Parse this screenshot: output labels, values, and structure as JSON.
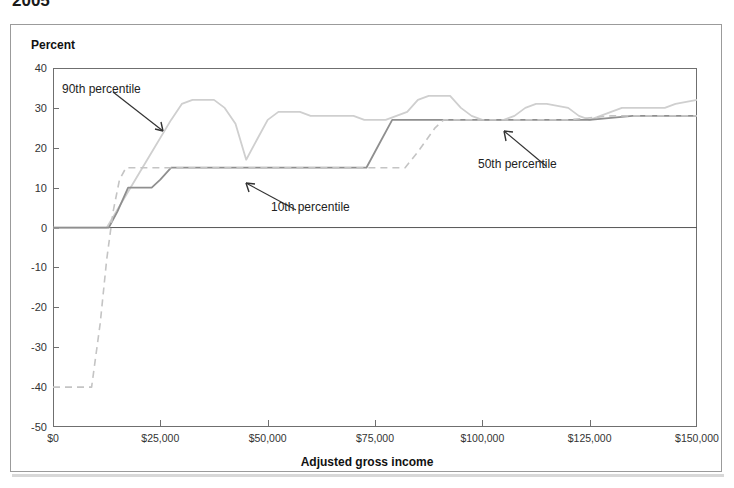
{
  "title_clipped": "2005",
  "axis": {
    "y_label": "Percent",
    "x_label": "Adjusted gross income",
    "y_ticks": [
      40,
      30,
      20,
      10,
      0,
      -10,
      -20,
      -30,
      -40,
      -50
    ],
    "x_ticks": [
      "$0",
      "$25,000",
      "$50,000",
      "$75,000",
      "$100,000",
      "$125,000",
      "$150,000"
    ]
  },
  "annotations": [
    {
      "name": "90th-percentile",
      "text": "90th percentile"
    },
    {
      "name": "10th-percentile",
      "text": "10th percentile"
    },
    {
      "name": "50th-percentile",
      "text": "50th percentile"
    }
  ],
  "colors": {
    "p90": "#cfcfcf",
    "p50": "#8f8f8f",
    "p10": "#c4c4c4",
    "axis": "#6f6f6f",
    "panel_border": "#9b9b9b",
    "text": "#1a1a1a"
  },
  "chart_data": {
    "type": "line",
    "title": "2005",
    "xlabel": "Adjusted gross income",
    "ylabel": "Percent",
    "xlim": [
      0,
      150000
    ],
    "ylim": [
      -50,
      40
    ],
    "grid": false,
    "legend": "annotated-inline",
    "x_tick_values": [
      0,
      25000,
      50000,
      75000,
      100000,
      125000,
      150000
    ],
    "y_tick_values": [
      40,
      30,
      20,
      10,
      0,
      -10,
      -20,
      -30,
      -40,
      -50
    ],
    "series": [
      {
        "name": "90th percentile",
        "style": "solid",
        "color": "#cfcfcf",
        "points": [
          [
            0,
            0
          ],
          [
            5000,
            0
          ],
          [
            10000,
            0
          ],
          [
            12500,
            0
          ],
          [
            17500,
            9
          ],
          [
            22500,
            18
          ],
          [
            27500,
            27
          ],
          [
            30000,
            31
          ],
          [
            32500,
            32
          ],
          [
            37500,
            32
          ],
          [
            40000,
            30
          ],
          [
            42500,
            26
          ],
          [
            45000,
            17
          ],
          [
            47500,
            22
          ],
          [
            50000,
            27
          ],
          [
            52500,
            29
          ],
          [
            57500,
            29
          ],
          [
            60000,
            28
          ],
          [
            62500,
            28
          ],
          [
            65000,
            28
          ],
          [
            70000,
            28
          ],
          [
            72500,
            27
          ],
          [
            75000,
            27
          ],
          [
            77500,
            27
          ],
          [
            82500,
            29
          ],
          [
            85000,
            32
          ],
          [
            87500,
            33
          ],
          [
            92500,
            33
          ],
          [
            95000,
            30
          ],
          [
            97500,
            28
          ],
          [
            100000,
            27
          ],
          [
            105000,
            27
          ],
          [
            107500,
            28
          ],
          [
            110000,
            30
          ],
          [
            112500,
            31
          ],
          [
            115000,
            31
          ],
          [
            120000,
            30
          ],
          [
            122500,
            28
          ],
          [
            125000,
            27
          ],
          [
            127500,
            28
          ],
          [
            130000,
            29
          ],
          [
            132500,
            30
          ],
          [
            135000,
            30
          ],
          [
            140000,
            30
          ],
          [
            142500,
            30
          ],
          [
            145000,
            31
          ],
          [
            150000,
            32
          ]
        ]
      },
      {
        "name": "50th percentile",
        "style": "solid",
        "color": "#8f8f8f",
        "points": [
          [
            0,
            0
          ],
          [
            5000,
            0
          ],
          [
            10000,
            0
          ],
          [
            13000,
            0
          ],
          [
            15000,
            4
          ],
          [
            17500,
            10
          ],
          [
            20000,
            10
          ],
          [
            23000,
            10
          ],
          [
            25000,
            12
          ],
          [
            27500,
            15
          ],
          [
            30000,
            15
          ],
          [
            40000,
            15
          ],
          [
            50000,
            15
          ],
          [
            60000,
            15
          ],
          [
            70000,
            15
          ],
          [
            73000,
            15
          ],
          [
            76000,
            21
          ],
          [
            79000,
            27
          ],
          [
            85000,
            27
          ],
          [
            95000,
            27
          ],
          [
            105000,
            27
          ],
          [
            115000,
            27
          ],
          [
            125000,
            27
          ],
          [
            135000,
            28
          ],
          [
            145000,
            28
          ],
          [
            150000,
            28
          ]
        ]
      },
      {
        "name": "10th percentile",
        "style": "dashed",
        "color": "#c4c4c4",
        "points": [
          [
            0,
            -40
          ],
          [
            5000,
            -40
          ],
          [
            9000,
            -40
          ],
          [
            11000,
            -24
          ],
          [
            12500,
            -8
          ],
          [
            14000,
            4
          ],
          [
            15500,
            12
          ],
          [
            17000,
            15
          ],
          [
            20000,
            15
          ],
          [
            30000,
            15
          ],
          [
            45000,
            15
          ],
          [
            60000,
            15
          ],
          [
            75000,
            15
          ],
          [
            82000,
            15
          ],
          [
            85000,
            19
          ],
          [
            89000,
            25
          ],
          [
            91000,
            27
          ],
          [
            100000,
            27
          ],
          [
            110000,
            27
          ],
          [
            120000,
            27
          ],
          [
            130000,
            28
          ],
          [
            140000,
            28
          ],
          [
            150000,
            28
          ]
        ]
      }
    ]
  }
}
